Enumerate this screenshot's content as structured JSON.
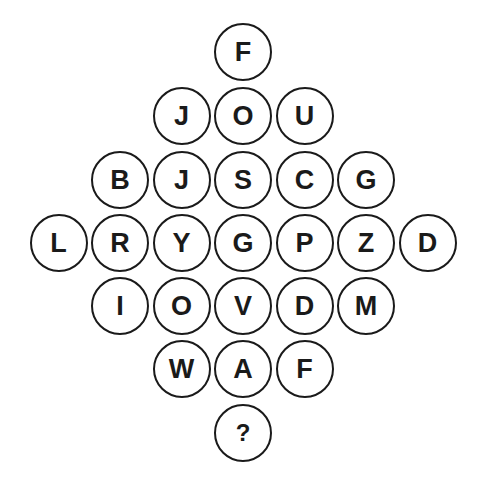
{
  "puzzle": {
    "layout": "diamond",
    "rows": [
      [
        "F"
      ],
      [
        "J",
        "O",
        "U"
      ],
      [
        "B",
        "J",
        "S",
        "C",
        "G"
      ],
      [
        "L",
        "R",
        "Y",
        "G",
        "P",
        "Z",
        "D"
      ],
      [
        "I",
        "O",
        "V",
        "D",
        "M"
      ],
      [
        "W",
        "A",
        "F"
      ],
      [
        "?"
      ]
    ],
    "missing_symbol": "?"
  },
  "colors": {
    "background": "#ffffff",
    "stroke": "#1a1a1a",
    "text": "#1a1a1a"
  }
}
